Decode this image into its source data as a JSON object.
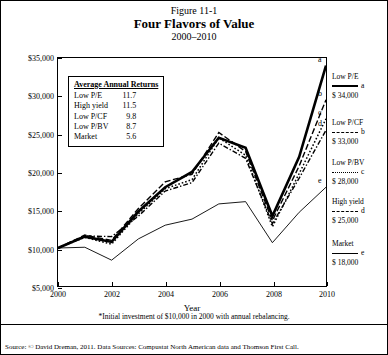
{
  "figure": {
    "number": "Figure 11-1",
    "title": "Four Flavors of Value",
    "subtitle": "2000–2010"
  },
  "axes": {
    "y_label": "$10,000 Becomes*",
    "x_label": "Year",
    "y_ticks": [
      "$5,000",
      "$10,000",
      "$15,000",
      "$20,000",
      "$25,000",
      "$30,000",
      "$35,000"
    ],
    "x_ticks": [
      "2000",
      "2002",
      "2004",
      "2006",
      "2008",
      "2010"
    ]
  },
  "avg_returns_box": {
    "header": "Average Annual Returns",
    "rows": [
      {
        "name": "Low P/E",
        "value": "11.7"
      },
      {
        "name": "High yield",
        "value": "11.5"
      },
      {
        "name": "Low P/CF",
        "value": "9.8"
      },
      {
        "name": "Low P/BV",
        "value": "8.7"
      },
      {
        "name": "Market",
        "value": "5.6"
      }
    ]
  },
  "series_labels": [
    {
      "name": "Low P/E",
      "tag": "a",
      "value": "$ 34,000",
      "style": "solid-thick"
    },
    {
      "name": "Low P/CF",
      "tag": "b",
      "value": "$ 33,000",
      "style": "dash"
    },
    {
      "name": "Low P/BV",
      "tag": "c",
      "value": "$ 28,000",
      "style": "dot"
    },
    {
      "name": "High yield",
      "tag": "d",
      "value": "$ 25,000",
      "style": "dashdot"
    },
    {
      "name": "Market",
      "tag": "e",
      "value": "$ 18,000",
      "style": "solid-thin"
    }
  ],
  "point_tags": [
    "a",
    "b",
    "c",
    "d",
    "e"
  ],
  "footnote": "*Initial investment of $10,000 in 2000 with annual rebalancing.",
  "source": "Source: © David Dreman, 2011. Data Sources: Compustat North American data and Thomson First Call.",
  "chart_data": {
    "type": "line",
    "title": "Four Flavors of Value",
    "subtitle": "2000–2010",
    "xlabel": "Year",
    "ylabel": "$10,000 Becomes*",
    "xlim": [
      2000,
      2010
    ],
    "ylim": [
      5000,
      35000
    ],
    "grid": false,
    "legend": "right",
    "x": [
      2000,
      2001,
      2002,
      2003,
      2004,
      2005,
      2006,
      2007,
      2008,
      2009,
      2010
    ],
    "series": [
      {
        "name": "Low P/E",
        "tag": "a",
        "avg_annual_return": "11.7",
        "end_value": "$ 34,000",
        "values": [
          10000,
          11500,
          10800,
          14800,
          18000,
          20000,
          24500,
          23200,
          14200,
          22000,
          34000
        ]
      },
      {
        "name": "Low P/CF",
        "tag": "b",
        "avg_annual_return": "9.8",
        "end_value": "$ 33,000",
        "values": [
          10000,
          11700,
          11000,
          15200,
          18700,
          19700,
          25200,
          22700,
          13600,
          20800,
          29500
        ]
      },
      {
        "name": "Low P/BV",
        "tag": "c",
        "avg_annual_return": "8.7",
        "end_value": "$ 28,000",
        "values": [
          10000,
          11400,
          10500,
          14500,
          17800,
          19000,
          24500,
          22200,
          12800,
          19800,
          27000
        ]
      },
      {
        "name": "High yield",
        "tag": "d",
        "avg_annual_return": "11.5",
        "end_value": "$ 25,000",
        "values": [
          10000,
          11600,
          11500,
          14200,
          17500,
          18600,
          23800,
          21800,
          13200,
          19200,
          25500
        ]
      },
      {
        "name": "Market",
        "tag": "e",
        "avg_annual_return": "5.6",
        "end_value": "$ 18,000",
        "values": [
          10000,
          10100,
          8400,
          11200,
          13000,
          13800,
          15800,
          16100,
          10700,
          14700,
          18000
        ]
      }
    ]
  }
}
